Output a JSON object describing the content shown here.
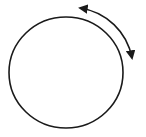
{
  "diagram": {
    "background": "#ffffff",
    "stroke_color": "#1a1a1a",
    "circle": {
      "cx": 66,
      "cy": 72.5,
      "rx": 57,
      "ry": 55.5
    },
    "arrow": {
      "type": "curved-double-headed",
      "start": [
        78,
        8
      ],
      "end": [
        133,
        61
      ]
    }
  }
}
